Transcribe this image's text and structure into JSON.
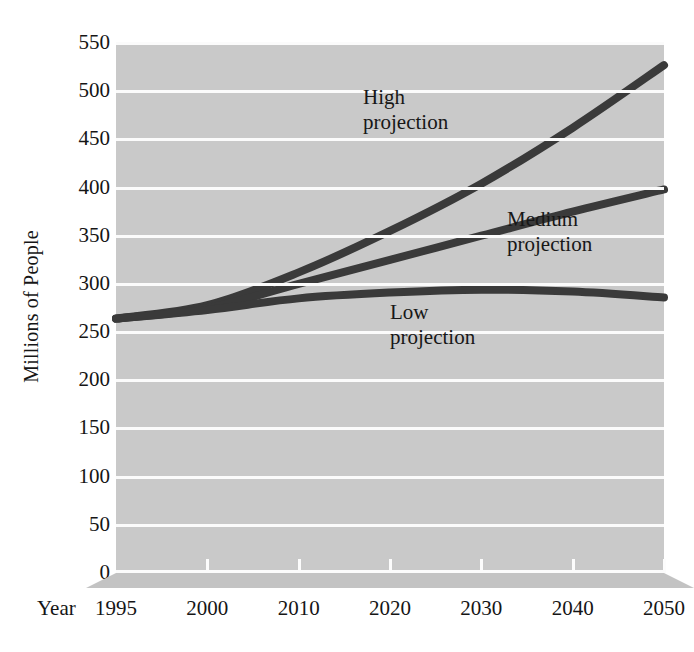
{
  "chart_data": {
    "type": "line",
    "title": "",
    "xlabel": "Year",
    "ylabel": "Millions of People",
    "x": [
      1995,
      2000,
      2010,
      2020,
      2030,
      2040,
      2050
    ],
    "xtick_labels": [
      "1995",
      "2000",
      "2010",
      "2020",
      "2030",
      "2040",
      "2050"
    ],
    "ytick_labels": [
      "0",
      "50",
      "100",
      "150",
      "200",
      "250",
      "300",
      "350",
      "400",
      "450",
      "500",
      "550"
    ],
    "ylim": [
      0,
      550
    ],
    "ytick_step": 50,
    "grid": true,
    "legend_position": "inline-annotations",
    "series": [
      {
        "name": "High projection",
        "annotation_lines": [
          "High",
          "projection"
        ],
        "values": [
          264,
          278,
          312,
          355,
          404,
          462,
          527
        ]
      },
      {
        "name": "Medium projection",
        "annotation_lines": [
          "Medium",
          "projection"
        ],
        "values": [
          264,
          275,
          300,
          325,
          350,
          375,
          398
        ]
      },
      {
        "name": "Low projection",
        "annotation_lines": [
          "Low",
          "projection"
        ],
        "values": [
          264,
          273,
          285,
          291,
          294,
          292,
          286
        ]
      }
    ],
    "colors": {
      "plot_background": "#c9c9c9",
      "gridline": "#fbfbfb",
      "series_line": "#3a3a3a",
      "base": "#c3c3c3",
      "text": "#151515",
      "page_background": "#ffffff"
    }
  },
  "axes": {
    "y_title": "Millions of People",
    "x_title": "Year"
  }
}
